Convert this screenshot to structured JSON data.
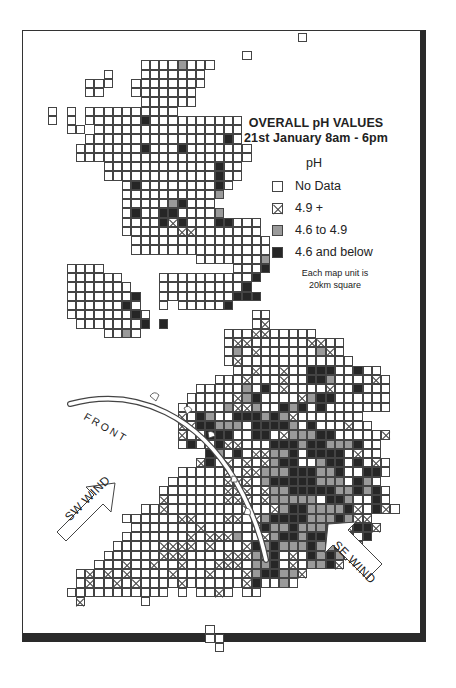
{
  "map": {
    "title_line1": "OVERALL pH VALUES",
    "title_line2": "21st January 8am - 6pm",
    "legend": {
      "heading": "pH",
      "items": [
        {
          "key": "o",
          "label": "No Data"
        },
        {
          "key": "x",
          "label": "4.9 +"
        },
        {
          "key": "g",
          "label": "4.6 to 4.9"
        },
        {
          "key": "b",
          "label": "4.6 and below"
        }
      ]
    },
    "note_line1": "Each map unit is",
    "note_line2": "20km square",
    "front_label": "FRONT",
    "sw_wind_label": "SW WIND",
    "se_wind_label": "SE WIND",
    "colors": {
      "gray": "#9a9a9a",
      "black": "#262626",
      "line": "#444444"
    },
    "grid": {
      "origin_x": 48,
      "origin_y": 88,
      "cell": 9.25,
      "rows": [
        "...........................o....",
        "..............................",
        ".....................o........",
        "..........oooogooo............",
        "......o...ooooooo.............",
        "....ooo..oooooooo.............",
        "....oo...ooooooo..............",
        "..........oooooo..............",
        "o.o.oooooooooo................",
        "o.o.ooooooboooooooooo.........",
        "..oo.oooooooooooooooo.........",
        "....ooooooooooooooobo.........",
        "...ooooooobooobooooooo........",
        "...ooooooooooooooooooo........",
        "......ooooooooooooboo.........",
        "......ooooooooooooboo.........",
        "........oboooooooobo..........",
        "........oooooooooog...........",
        "........ooooogbooo............",
        "........oboobboooog...........",
        "........oooobxbooobbooo.......",
        "........ooooooxxooooooo.......",
        ".........ooooooooooooooo......",
        ".........ooooooooooooooo......",
        "................ooooooog......",
        "..oooo..............ooob......",
        "..oooooo....oooooooooob.......",
        "..ooooooo...ooooooooob........",
        "..ooooooob..oooooooobbb.......",
        "..oooooobo..o.ooooob..........",
        "..ooooooobo...........oo......",
        "...ooooooob.b.........ox......",
        "......oogo.........oooxxooooo..",
        "...................oxxooooooxxoo.",
        "...................ogoxoooooogxo..",
        "...................oxoooooooooooo..",
        "....................ooxooxoobbbooboo.",
        "..................oooxoooxoobbgooooxo",
        "................ooooogoboxooooxoobooo",
        "...............oooooxgbooooxgbboooooo",
        "..............ooooogxxgoobgbobooooooo",
        "..............xobgoobbbgbgxooooooo..",
        "..............xxbbgggobbbbgoboooxoo.",
        "..............xoobbboobboxgggbbooooox",
        "..............oboobxxooobbbgbbgggboo.",
        ".................bgoboxxggbobbbboxoo.",
        "................xboxoxoxgbboogbboboxo",
        "..............oooooxoxxgggbbbggboobbo",
        ".............ooooooxxxogbbbbbgggobgo.",
        "............oooooooxxxoxggbbbbbggbgbo",
        "............xooooooxxxoxgggggobbgoobo",
        "..........ooxooooooooxooxgbbggggbxobxo",
        "........ooooooxxoooxxoxgbbbbgggbgxx..",
        ".........oooooooxoooooxbggbgggbgxbbx.",
        "........oooooooxoxxxgooxgbbgbbbobob..",
        ".......oooooxxxxoxoooxbgbgggbgggbx...",
        "......ooooooxxxooooxxxggboxobgbgx....",
        ".....oooxooxooxoooxxxoggboxoggbx.....",
        "...oxoxoxooooxoooxoooxgbbggx.........",
        "...oxooxoxooooxooooooxboogo..........",
        "..ooooooooooo.o.ooxo.oo..............",
        "...x......o...........................",
        "..............................",
        "..............................",
        ".................o............",
        ".................oo...........",
        "..................o..........."
      ]
    }
  }
}
